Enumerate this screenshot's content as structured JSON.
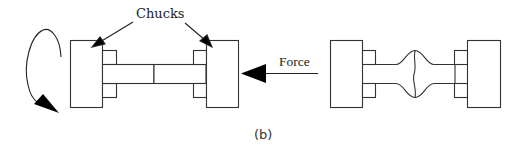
{
  "figure": {
    "caption": "(b)",
    "labels": {
      "chucks": "Chucks",
      "force": "Force"
    },
    "colors": {
      "stroke": "#333333",
      "fill": "#ffffff",
      "arrow": "#000000",
      "background": "#ffffff"
    },
    "panels": [
      {
        "name": "torsion-setup",
        "description": "Specimen held between two chucks with rotation arrow on left"
      },
      {
        "name": "deformed-specimen",
        "description": "Specimen between chucks showing barrel-shaped bulge at center after axial force"
      }
    ]
  }
}
